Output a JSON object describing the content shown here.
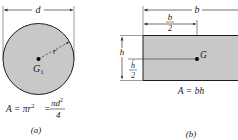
{
  "colors": {
    "fill": "#c8c8c8",
    "stroke": "#1e1e1e",
    "dim_line": "#333333",
    "background": "#ffffff"
  },
  "figure_a": {
    "caption": "(a)",
    "dimension_label": "d",
    "radius_label": "r",
    "centroid_label": "G",
    "centroid_subscript": "1",
    "formula": {
      "lhs": "A = πr",
      "lhs_exp": "2",
      "eq": "=",
      "frac_num": "πd",
      "frac_num_exp": "2",
      "frac_den": "4"
    }
  },
  "figure_b": {
    "caption": "(b)",
    "width_label": "b",
    "half_width_num": "b",
    "half_width_den": "2",
    "height_label": "h",
    "half_height_num": "h",
    "half_height_den": "2",
    "centroid_label": "G",
    "formula": "A = bh"
  }
}
